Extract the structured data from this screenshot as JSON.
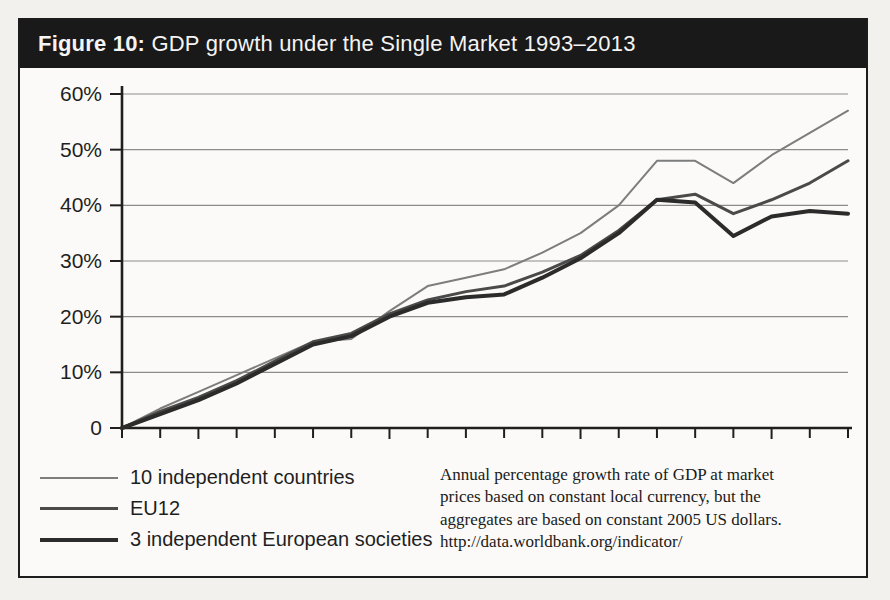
{
  "figure": {
    "label": "Figure 10:",
    "title": " GDP growth under the Single Market 1993–2013",
    "band_color": "#191919",
    "border_color": "#1c1c1c",
    "page_background": "#f2f1ee"
  },
  "note": {
    "lines": [
      "Annual percentage growth rate of GDP at market",
      "prices based on constant local currency, but the",
      "aggregates are based on constant 2005 US dollars.",
      "http://data.worldbank.org/indicator/"
    ]
  },
  "legend": {
    "items": [
      {
        "label": "10 independent countries",
        "color": "#7d7d7d",
        "width": 2
      },
      {
        "label": "EU12",
        "color": "#4a4a4a",
        "width": 3
      },
      {
        "label": "3 independent European societies",
        "color": "#2b2b2b",
        "width": 4
      }
    ]
  },
  "chart_data": {
    "type": "line",
    "title": "GDP growth under the Single Market 1993–2013",
    "xlabel": "",
    "ylabel": "",
    "x": [
      1993,
      1994,
      1995,
      1996,
      1997,
      1998,
      1999,
      2000,
      2001,
      2002,
      2003,
      2004,
      2005,
      2006,
      2007,
      2008,
      2009,
      2010,
      2011,
      2012
    ],
    "xlim": [
      1993,
      2012
    ],
    "ylim": [
      0,
      60
    ],
    "yticks": [
      0,
      10,
      20,
      30,
      40,
      50,
      60
    ],
    "ytick_labels": [
      "0",
      "10%",
      "20%",
      "30%",
      "40%",
      "50%",
      "60%"
    ],
    "xticks": [
      1995,
      2000,
      2005,
      2010
    ],
    "xtick_labels": [
      "1995",
      "2000",
      "2005",
      "2010"
    ],
    "grid": "horizontal",
    "legend_position": "below-left",
    "series": [
      {
        "name": "10 independent countries",
        "color": "#7d7d7d",
        "width": 2,
        "values": [
          0,
          3.5,
          6.5,
          9.5,
          12.5,
          15.5,
          16.0,
          21.0,
          25.5,
          27.0,
          28.5,
          31.5,
          35.0,
          40.0,
          48.0,
          48.0,
          44.0,
          49.0,
          53.0,
          57.0
        ]
      },
      {
        "name": "EU12",
        "color": "#4a4a4a",
        "width": 3,
        "values": [
          0,
          3.0,
          5.5,
          8.5,
          12.0,
          15.5,
          17.0,
          20.5,
          23.0,
          24.5,
          25.5,
          28.0,
          31.0,
          35.5,
          41.0,
          42.0,
          38.5,
          41.0,
          44.0,
          48.0
        ]
      },
      {
        "name": "3 independent European societies",
        "color": "#2b2b2b",
        "width": 4,
        "values": [
          0,
          2.5,
          5.0,
          8.0,
          11.5,
          15.0,
          16.5,
          20.0,
          22.5,
          23.5,
          24.0,
          27.0,
          30.5,
          35.0,
          41.0,
          40.5,
          34.5,
          38.0,
          39.0,
          38.5
        ]
      }
    ]
  },
  "axes": {
    "axis_color": "#1f1f1f",
    "grid_color": "#8c8c8c"
  }
}
